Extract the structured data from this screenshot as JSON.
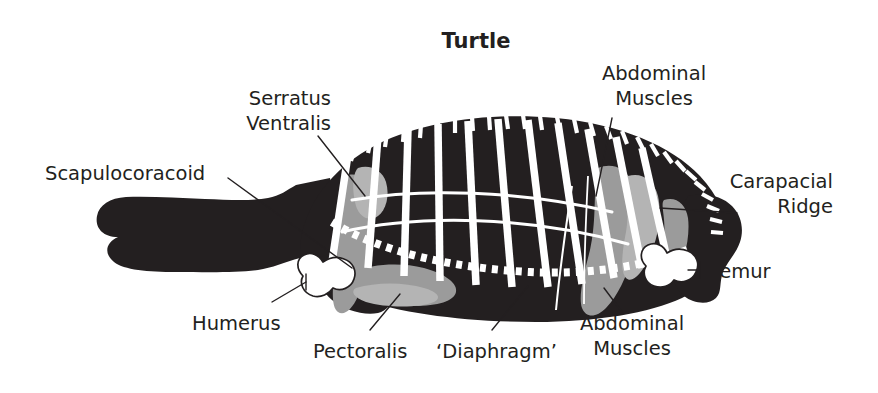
{
  "figure": {
    "title": "Turtle",
    "width": 878,
    "height": 393
  },
  "colors": {
    "background": "#ffffff",
    "body_silhouette": "#231f20",
    "muscle_gray": "#9b9b9b",
    "muscle_gray_light": "#b4b4b4",
    "rib_white": "#ffffff",
    "text": "#231f20"
  },
  "labels": {
    "serratus_ventralis": {
      "line1": "Serratus",
      "line2": "Ventralis"
    },
    "abdominal_muscles_top": {
      "line1": "Abdominal",
      "line2": "Muscles"
    },
    "abdominal_muscles_bottom": {
      "line1": "Abdominal",
      "line2": "Muscles"
    },
    "scapulocoracoid": "Scapulocoracoid",
    "carapacial_ridge": {
      "line1": "Carapacial",
      "line2": "Ridge"
    },
    "femur": "Femur",
    "humerus": "Humerus",
    "pectoralis": "Pectoralis",
    "diaphragm": "‘Diaphragm’"
  },
  "anatomy_parts": [
    "carapace",
    "ribs",
    "scapulocoracoid",
    "serratus-ventralis",
    "abdominal-muscles",
    "carapacial-ridge",
    "humerus",
    "femur",
    "pectoralis",
    "diaphragm",
    "head",
    "neck",
    "forelimb",
    "hindlimb"
  ],
  "counts": {
    "ribs": 11,
    "carapace_rim_ticks": 30,
    "diaphragm_dashes": 34
  }
}
